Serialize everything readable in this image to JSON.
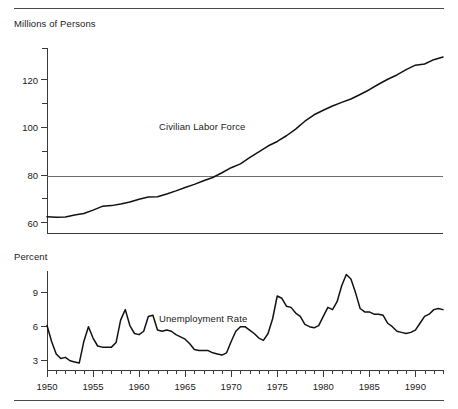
{
  "figure": {
    "top_rule": "",
    "bottom_rule": ""
  },
  "panels": {
    "top": {
      "axis_title": "Millions of Persons",
      "series_label": "Civilian Labor Force",
      "y_ticks_major": [
        "120",
        "100",
        "80",
        "60"
      ],
      "reference_line_value": "80"
    },
    "bottom": {
      "axis_title": "Percent",
      "series_label": "Unemployment Rate",
      "y_ticks_major": [
        "9",
        "6",
        "3"
      ]
    }
  },
  "x_axis": {
    "labels": [
      "1950",
      "1955",
      "1960",
      "1965",
      "1970",
      "1975",
      "1980",
      "1985",
      "1990"
    ]
  },
  "chart_data": [
    {
      "type": "line",
      "title": "Civilian Labor Force",
      "subtitle": "",
      "xlabel": "",
      "ylabel": "Millions of Persons",
      "xlim": [
        1950,
        1993
      ],
      "ylim": [
        55,
        133
      ],
      "yticks": [
        60,
        70,
        80,
        90,
        100,
        110,
        120,
        130
      ],
      "ytick_labels_shown": [
        60,
        80,
        100,
        120
      ],
      "xticks_major": [
        1950,
        1955,
        1960,
        1965,
        1970,
        1975,
        1980,
        1985,
        1990
      ],
      "xticks_minor_interval": 1,
      "grid": false,
      "legend": "inline-annotation",
      "annotations": [
        {
          "text": "Civilian Labor Force",
          "x": 1966.5,
          "y": 103
        }
      ],
      "reference_lines": [
        {
          "axis": "y",
          "value": 80
        }
      ],
      "x": [
        1950,
        1951,
        1952,
        1953,
        1954,
        1955,
        1956,
        1957,
        1958,
        1959,
        1960,
        1961,
        1962,
        1963,
        1964,
        1965,
        1966,
        1967,
        1968,
        1969,
        1970,
        1971,
        1972,
        1973,
        1974,
        1975,
        1976,
        1977,
        1978,
        1979,
        1980,
        1981,
        1982,
        1983,
        1984,
        1985,
        1986,
        1987,
        1988,
        1989,
        1990,
        1991,
        1992,
        1993
      ],
      "values": [
        62.2,
        62.0,
        62.1,
        63.0,
        63.6,
        65.0,
        66.6,
        66.9,
        67.6,
        68.4,
        69.6,
        70.5,
        70.6,
        71.8,
        73.1,
        74.5,
        75.8,
        77.3,
        78.7,
        80.7,
        82.8,
        84.4,
        87.0,
        89.4,
        91.9,
        93.8,
        96.2,
        99.0,
        102.3,
        105.0,
        106.9,
        108.7,
        110.2,
        111.6,
        113.5,
        115.5,
        117.8,
        119.9,
        121.7,
        123.9,
        125.8,
        126.3,
        128.1,
        129.2
      ]
    },
    {
      "type": "line",
      "title": "Unemployment Rate",
      "subtitle": "",
      "xlabel": "",
      "ylabel": "Percent",
      "xlim": [
        1950,
        1993
      ],
      "ylim": [
        2.0,
        10.8
      ],
      "yticks": [
        3,
        6,
        9
      ],
      "ytick_labels_shown": [
        3,
        6,
        9
      ],
      "xticks_major": [
        1950,
        1955,
        1960,
        1965,
        1970,
        1975,
        1980,
        1985,
        1990
      ],
      "xticks_minor_interval": 1,
      "grid": false,
      "legend": "inline-annotation",
      "annotations": [
        {
          "text": "Unemployment Rate",
          "x": 1966.5,
          "y": 8.4
        }
      ],
      "x": [
        1950,
        1950.5,
        1951,
        1951.5,
        1952,
        1952.5,
        1953,
        1953.5,
        1954,
        1954.5,
        1955,
        1955.5,
        1956,
        1956.5,
        1957,
        1957.5,
        1958,
        1958.5,
        1959,
        1959.5,
        1960,
        1960.5,
        1961,
        1961.5,
        1962,
        1962.5,
        1963,
        1963.5,
        1964,
        1964.5,
        1965,
        1965.5,
        1966,
        1966.5,
        1967,
        1967.5,
        1968,
        1968.5,
        1969,
        1969.5,
        1970,
        1970.5,
        1971,
        1971.5,
        1972,
        1972.5,
        1973,
        1973.5,
        1974,
        1974.5,
        1975,
        1975.5,
        1976,
        1976.5,
        1977,
        1977.5,
        1978,
        1978.5,
        1979,
        1979.5,
        1980,
        1980.5,
        1981,
        1981.5,
        1982,
        1982.5,
        1983,
        1983.5,
        1984,
        1984.5,
        1985,
        1985.5,
        1986,
        1986.5,
        1987,
        1987.5,
        1988,
        1988.5,
        1989,
        1989.5,
        1990,
        1990.5,
        1991,
        1991.5,
        1992,
        1992.5,
        1993
      ],
      "values": [
        6.0,
        4.6,
        3.5,
        3.1,
        3.2,
        2.9,
        2.8,
        2.7,
        4.6,
        5.9,
        4.9,
        4.2,
        4.1,
        4.1,
        4.1,
        4.5,
        6.5,
        7.4,
        6.0,
        5.3,
        5.2,
        5.5,
        6.8,
        6.9,
        5.6,
        5.5,
        5.6,
        5.5,
        5.2,
        5.0,
        4.8,
        4.4,
        3.9,
        3.8,
        3.8,
        3.8,
        3.6,
        3.5,
        3.4,
        3.6,
        4.6,
        5.5,
        5.9,
        5.9,
        5.6,
        5.3,
        4.9,
        4.7,
        5.3,
        6.6,
        8.6,
        8.4,
        7.7,
        7.6,
        7.1,
        6.8,
        6.1,
        5.9,
        5.8,
        6.0,
        6.8,
        7.6,
        7.4,
        8.1,
        9.5,
        10.5,
        10.1,
        8.9,
        7.5,
        7.2,
        7.2,
        7.0,
        7.0,
        6.9,
        6.2,
        5.9,
        5.5,
        5.4,
        5.3,
        5.4,
        5.6,
        6.2,
        6.8,
        7.0,
        7.4,
        7.5,
        7.4
      ]
    }
  ]
}
